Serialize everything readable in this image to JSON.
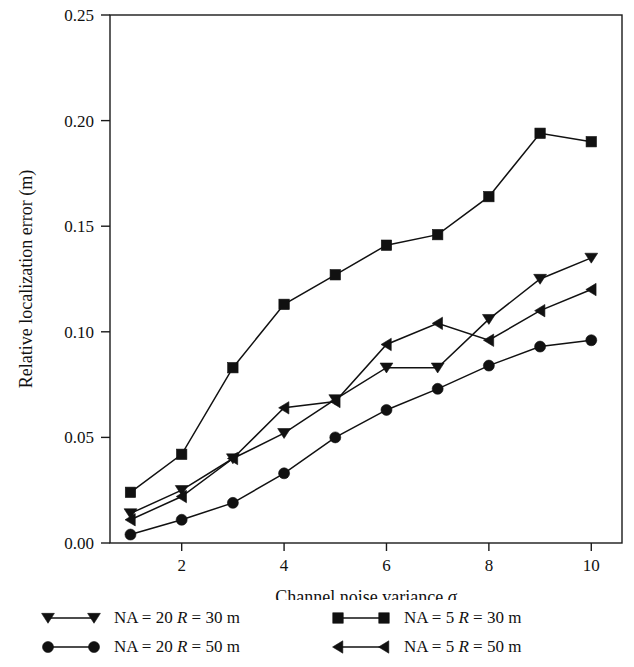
{
  "chart_data": {
    "type": "line",
    "title": "",
    "xlabel": "Channel noise variance σ",
    "ylabel": "Relative localization error (m)",
    "x": [
      1,
      2,
      3,
      4,
      5,
      6,
      7,
      8,
      9,
      10
    ],
    "xlim": [
      0.6,
      10.6
    ],
    "ylim": [
      0.0,
      0.25
    ],
    "xticks": [
      2,
      4,
      6,
      8,
      10
    ],
    "xtick_labels": [
      "2",
      "4",
      "6",
      "8",
      "10"
    ],
    "yticks": [
      0.0,
      0.05,
      0.1,
      0.15,
      0.2,
      0.25
    ],
    "ytick_labels": [
      "0.00",
      "0.05",
      "0.10",
      "0.15",
      "0.20",
      "0.25"
    ],
    "grid": false,
    "legend_position": "below",
    "series": [
      {
        "name": "NA = 20 R = 30 m",
        "marker": "triangle-down",
        "color": "#111111",
        "values": [
          0.014,
          0.025,
          0.04,
          0.052,
          0.068,
          0.083,
          0.083,
          0.106,
          0.125,
          0.135
        ]
      },
      {
        "name": "NA = 20 R = 50 m",
        "marker": "circle",
        "color": "#111111",
        "values": [
          0.004,
          0.011,
          0.019,
          0.033,
          0.05,
          0.063,
          0.073,
          0.084,
          0.093,
          0.096
        ]
      },
      {
        "name": "NA = 5 R = 30 m",
        "marker": "square",
        "color": "#111111",
        "values": [
          0.024,
          0.042,
          0.083,
          0.113,
          0.127,
          0.141,
          0.146,
          0.164,
          0.194,
          0.19
        ]
      },
      {
        "name": "NA = 5 R = 50 m",
        "marker": "triangle-left",
        "color": "#111111",
        "values": [
          0.011,
          0.022,
          0.04,
          0.064,
          0.067,
          0.094,
          0.104,
          0.096,
          0.11,
          0.12
        ]
      }
    ]
  },
  "legend": {
    "entries": [
      {
        "label_prefix": "NA = 20 ",
        "label_italic": "R",
        "label_suffix": " = 30 m",
        "marker": "triangle-down"
      },
      {
        "label_prefix": "NA = 5 ",
        "label_italic": "R",
        "label_suffix": " = 30 m",
        "marker": "square"
      },
      {
        "label_prefix": "NA = 20 ",
        "label_italic": "R",
        "label_suffix": " = 50 m",
        "marker": "circle"
      },
      {
        "label_prefix": "NA = 5 ",
        "label_italic": "R",
        "label_suffix": " = 50 m",
        "marker": "triangle-left"
      }
    ]
  },
  "axes": {
    "xlabel_text": "Channel noise variance ",
    "xlabel_symbol": "σ",
    "ylabel_text": "Relative localization error (m)"
  }
}
